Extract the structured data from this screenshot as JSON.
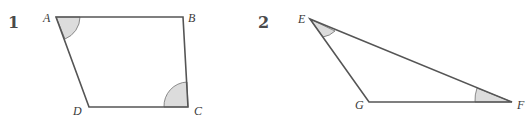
{
  "figures": [
    {
      "number": "1",
      "shape": "quadrilateral",
      "vertices": [
        "A",
        "B",
        "C",
        "D"
      ],
      "marked_angles": [
        "A",
        "C"
      ]
    },
    {
      "number": "2",
      "shape": "triangle",
      "vertices": [
        "E",
        "F",
        "G"
      ],
      "marked_angles": [
        "E",
        "F"
      ]
    }
  ],
  "colors": {
    "angle_fill": "#dcdcdc",
    "line": "#555555"
  }
}
